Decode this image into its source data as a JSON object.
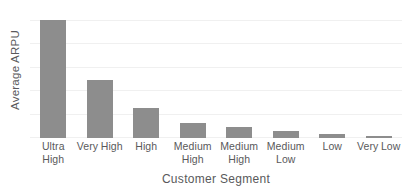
{
  "chart_data": {
    "type": "bar",
    "title": "",
    "xlabel": "Customer Segment",
    "ylabel": "Average ARPU",
    "categories": [
      "Ultra High",
      "Very High",
      "High",
      "Medium High",
      "Medium High",
      "Medium Low",
      "Low",
      "Very Low"
    ],
    "values": [
      100,
      49,
      25,
      13,
      9,
      6,
      3,
      1.5
    ],
    "ylim": [
      0,
      110
    ],
    "grid": true,
    "grid_axis": "y",
    "legend": "none",
    "bar_color": "#8d8d8d",
    "gridline_color": "#f0f0f0",
    "text_color": "#59595b",
    "background_color": "#ffffff",
    "axis_tick_labels_y": [],
    "series": [
      {
        "name": "Average ARPU",
        "values": [
          100,
          49,
          25,
          13,
          9,
          6,
          3,
          1.5
        ]
      }
    ]
  },
  "gridlines_percent": [
    0,
    18,
    36,
    54,
    72,
    90
  ]
}
